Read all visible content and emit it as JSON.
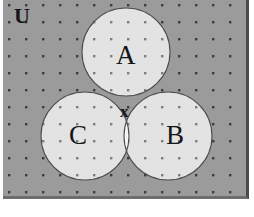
{
  "figure": {
    "kind": "venn-diagram",
    "set_count": 3,
    "background_color": "#9b9b9b",
    "circle_fill_color": "#e3e3e3",
    "overlap_fill_color": "#f4f4f4",
    "triple_overlap_fill_color": "#fbfbfb",
    "outline_color": "#4d4d4d",
    "dot_color": "#2b2b2b",
    "dot_spacing_px": 17,
    "border_color": "#4a4a4a"
  },
  "labels": {
    "universe": "U",
    "set_a": "A",
    "set_b": "B",
    "set_c": "C",
    "element_x": "x"
  },
  "geometry": {
    "frame": {
      "x": 3,
      "y": 0,
      "width": 246,
      "height": 199
    },
    "circles": [
      {
        "name": "A",
        "cx": 126,
        "cy": 52,
        "r": 44
      },
      {
        "name": "C",
        "cx": 85,
        "cy": 136,
        "r": 44
      },
      {
        "name": "B",
        "cx": 168,
        "cy": 136,
        "r": 44
      }
    ]
  }
}
